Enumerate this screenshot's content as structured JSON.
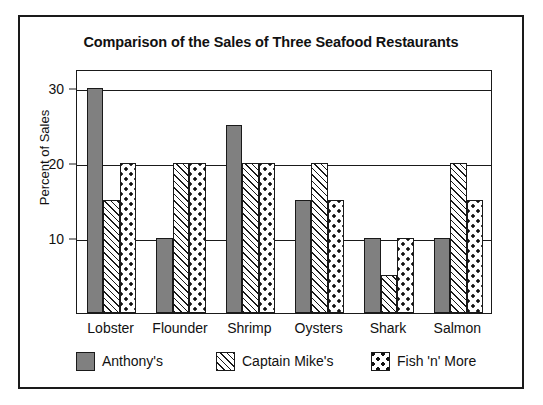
{
  "chart_data": {
    "type": "bar",
    "title": "Comparison of the Sales of Three Seafood Restaurants",
    "xlabel": "",
    "ylabel": "Percent of Sales",
    "ylim": [
      0,
      32.5
    ],
    "yticks": [
      10,
      20,
      30
    ],
    "ytick_labels": [
      "10",
      "20",
      "30"
    ],
    "grid": true,
    "legend_position": "bottom",
    "categories": [
      "Lobster",
      "Flounder",
      "Shrimp",
      "Oysters",
      "Shark",
      "Salmon"
    ],
    "series": [
      {
        "name": "Anthony's",
        "pattern": "solid-gray",
        "color": "#808080",
        "values": [
          30,
          10,
          25,
          15,
          10,
          10
        ]
      },
      {
        "name": "Captain Mike's",
        "pattern": "diagonal-hatch",
        "color": "#f2f2f2",
        "values": [
          15,
          20,
          20,
          20,
          5,
          20
        ]
      },
      {
        "name": "Fish 'n' More",
        "pattern": "polka-dot",
        "color": "#ffffff",
        "values": [
          20,
          20,
          20,
          15,
          10,
          15
        ]
      }
    ]
  },
  "figure": {
    "frame_color": "#1a1a1a",
    "background": "#ffffff"
  }
}
